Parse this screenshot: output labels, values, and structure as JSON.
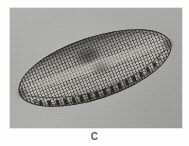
{
  "figure": {
    "label": "C",
    "kind": "photomicrograph",
    "caption_position": "below"
  },
  "micrograph": {
    "alt_text": "Light micrograph of an elliptical diatom valve with fine transapical striae and dark marginal fibulae",
    "background_color": "#a8a8a5",
    "frame": {
      "left": 10,
      "top": 8,
      "width": 172,
      "height": 120
    }
  },
  "specimen": {
    "name": "diatom-valve",
    "outline": "elliptical-lanceolate",
    "rotation_deg": -18.5,
    "outline_color": "#23211e",
    "interior_color": "#a6a49f",
    "features": [
      {
        "name": "transapical-striae",
        "description": "fine parallel ribs across the valve"
      },
      {
        "name": "puncta-rows",
        "description": "longitudinal rows of pores forming a grid"
      },
      {
        "name": "axial-area",
        "description": "clearer longitudinal band along the centre"
      },
      {
        "name": "marginal-fibulae",
        "description": "dark blocky dashes along the ventral margin"
      },
      {
        "name": "central-blotch",
        "description": "dark smudge near the upper centre"
      }
    ]
  },
  "artifacts": [
    {
      "name": "debris-speck",
      "description": "small bright round speck in the upper right field"
    }
  ],
  "colors": {
    "page_background": "#fdfdfd",
    "field_background": "#a8a8a5",
    "valve_outline": "#23211e",
    "caption_text": "#5d5d5d"
  }
}
